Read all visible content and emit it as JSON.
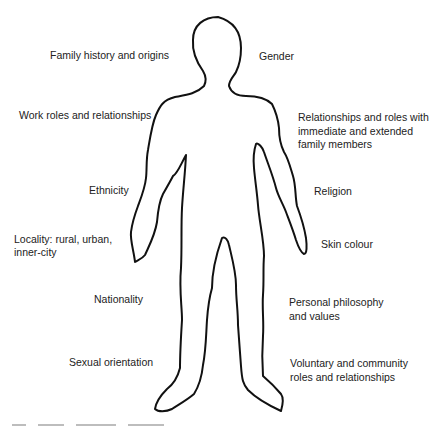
{
  "diagram": {
    "type": "labelled body outline",
    "colors": {
      "outline": "#111111",
      "text": "#222222",
      "background": "#ffffff"
    },
    "left_labels": [
      {
        "id": "family-history",
        "text": "Family history and origins"
      },
      {
        "id": "work-roles",
        "text": "Work roles and relationships"
      },
      {
        "id": "ethnicity",
        "text": "Ethnicity"
      },
      {
        "id": "locality",
        "lines": [
          "Locality: rural, urban,",
          "inner-city"
        ]
      },
      {
        "id": "nationality",
        "text": "Nationality"
      },
      {
        "id": "sexual-orientation",
        "text": "Sexual orientation"
      }
    ],
    "right_labels": [
      {
        "id": "gender",
        "text": "Gender"
      },
      {
        "id": "family-relationships",
        "lines": [
          "Relationships and roles with",
          "immediate and extended",
          "family members"
        ]
      },
      {
        "id": "religion",
        "text": "Religion"
      },
      {
        "id": "skin-colour",
        "text": "Skin colour"
      },
      {
        "id": "personal-philosophy",
        "lines": [
          "Personal philosophy",
          "and values"
        ]
      },
      {
        "id": "voluntary-community",
        "lines": [
          "Voluntary and community",
          "roles and relationships"
        ]
      }
    ]
  }
}
